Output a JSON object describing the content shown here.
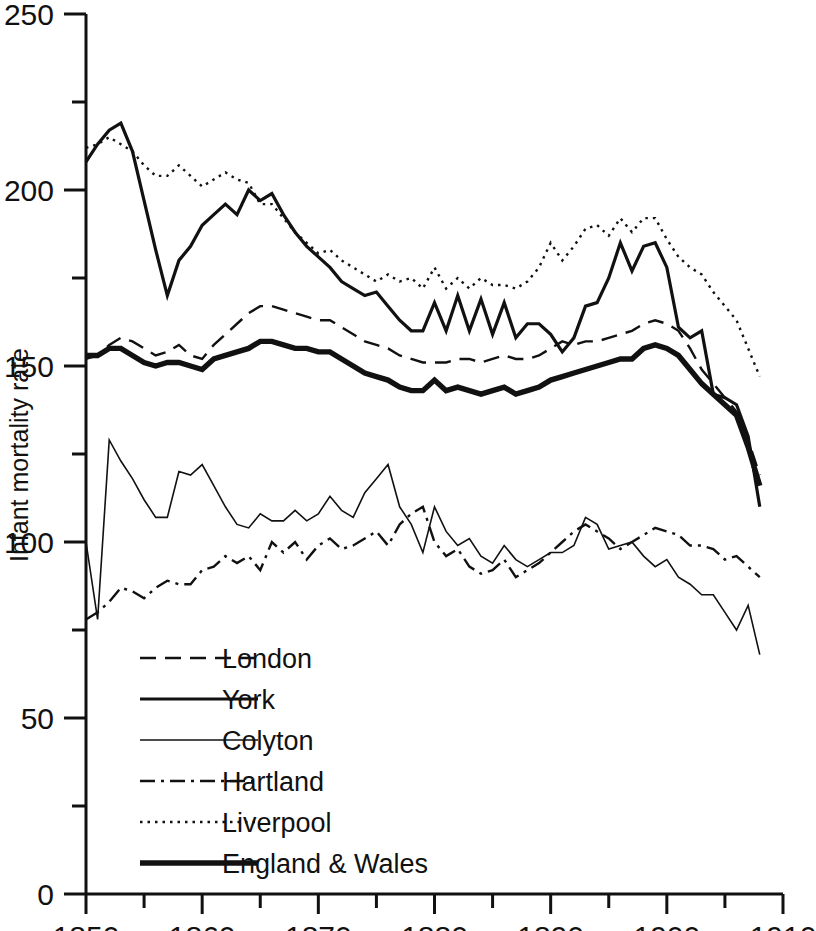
{
  "chart_data": {
    "type": "line",
    "title": "",
    "xlabel": "",
    "ylabel": "Infant mortality rate",
    "xlim": [
      1850,
      1910
    ],
    "ylim": [
      0,
      250
    ],
    "grid": false,
    "legend_position": "lower-left-inside",
    "x_ticks_major": [
      1850,
      1860,
      1870,
      1880,
      1890,
      1900,
      1910
    ],
    "x_ticks_minor": [
      1855,
      1865,
      1875,
      1885,
      1895,
      1905
    ],
    "x_tick_labels": [
      "1850",
      "1860",
      "1870",
      "1880",
      "1890",
      "1900",
      "1910"
    ],
    "y_ticks_major": [
      0,
      50,
      100,
      150,
      200,
      250
    ],
    "y_ticks_minor": [
      25,
      75,
      125,
      175,
      225
    ],
    "y_tick_labels": [
      "0",
      "50",
      "100",
      "150",
      "200",
      "250"
    ],
    "x": [
      1850,
      1851,
      1852,
      1853,
      1854,
      1855,
      1856,
      1857,
      1858,
      1859,
      1860,
      1861,
      1862,
      1863,
      1864,
      1865,
      1866,
      1867,
      1868,
      1869,
      1870,
      1871,
      1872,
      1873,
      1874,
      1875,
      1876,
      1877,
      1878,
      1879,
      1880,
      1881,
      1882,
      1883,
      1884,
      1885,
      1886,
      1887,
      1888,
      1889,
      1890,
      1891,
      1892,
      1893,
      1894,
      1895,
      1896,
      1897,
      1898,
      1899,
      1900,
      1901,
      1902,
      1903,
      1904,
      1905,
      1906,
      1907,
      1908
    ],
    "series": [
      {
        "name": "London",
        "style": "dashed",
        "width": 2.4,
        "values": [
          152,
          153,
          156,
          158,
          157,
          155,
          153,
          154,
          156,
          153,
          152,
          156,
          159,
          162,
          165,
          167,
          167,
          166,
          165,
          164,
          163,
          163,
          161,
          159,
          157,
          156,
          155,
          153,
          152,
          151,
          151,
          151,
          152,
          152,
          151,
          152,
          153,
          152,
          152,
          153,
          155,
          157,
          156,
          157,
          157,
          158,
          159,
          160,
          162,
          163,
          162,
          160,
          155,
          149,
          145,
          141,
          137,
          129,
          119
        ]
      },
      {
        "name": "York",
        "style": "solid",
        "width": 3.2,
        "values": [
          208,
          213,
          217,
          219,
          211,
          197,
          183,
          170,
          180,
          184,
          190,
          193,
          196,
          193,
          200,
          197,
          199,
          193,
          188,
          184,
          181,
          178,
          174,
          172,
          170,
          171,
          167,
          163,
          160,
          160,
          168,
          160,
          170,
          160,
          169,
          159,
          168,
          158,
          162,
          162,
          159,
          154,
          158,
          167,
          168,
          175,
          185,
          177,
          184,
          185,
          178,
          161,
          158,
          160,
          142,
          141,
          139,
          130,
          110
        ]
      },
      {
        "name": "Colyton",
        "style": "solid-thin",
        "width": 1.6,
        "values": [
          100,
          78,
          129,
          123,
          118,
          112,
          107,
          107,
          120,
          119,
          122,
          116,
          110,
          105,
          104,
          108,
          106,
          106,
          109,
          106,
          108,
          113,
          109,
          107,
          114,
          118,
          122,
          110,
          105,
          97,
          110,
          103,
          99,
          101,
          96,
          94,
          99,
          95,
          93,
          95,
          97,
          97,
          99,
          107,
          105,
          98,
          99,
          100,
          96,
          93,
          95,
          90,
          88,
          85,
          85,
          80,
          75,
          82,
          68
        ]
      },
      {
        "name": "Hartland",
        "style": "dash-dot",
        "width": 2.4,
        "values": [
          78,
          80,
          83,
          87,
          86,
          84,
          87,
          89,
          88,
          88,
          92,
          93,
          96,
          94,
          96,
          92,
          100,
          97,
          100,
          95,
          99,
          101,
          98,
          99,
          101,
          103,
          99,
          105,
          108,
          110,
          100,
          96,
          98,
          93,
          91,
          92,
          95,
          90,
          92,
          94,
          97,
          100,
          103,
          105,
          103,
          101,
          98,
          100,
          102,
          104,
          103,
          102,
          99,
          99,
          98,
          95,
          96,
          93,
          90
        ]
      },
      {
        "name": "Liverpool",
        "style": "dotted",
        "width": 2.4,
        "values": [
          212,
          213,
          215,
          213,
          211,
          207,
          204,
          204,
          207,
          204,
          201,
          203,
          205,
          203,
          202,
          196,
          196,
          192,
          188,
          185,
          182,
          183,
          180,
          178,
          176,
          174,
          176,
          174,
          175,
          172,
          178,
          172,
          175,
          172,
          175,
          173,
          173,
          172,
          174,
          178,
          185,
          180,
          184,
          189,
          190,
          187,
          192,
          188,
          192,
          192,
          186,
          181,
          178,
          176,
          171,
          167,
          163,
          155,
          147
        ]
      },
      {
        "name": "England & Wales",
        "style": "solid-thick",
        "width": 5.4,
        "values": [
          153,
          153,
          155,
          155,
          153,
          151,
          150,
          151,
          151,
          150,
          149,
          152,
          153,
          154,
          155,
          157,
          157,
          156,
          155,
          155,
          154,
          154,
          152,
          150,
          148,
          147,
          146,
          144,
          143,
          143,
          146,
          143,
          144,
          143,
          142,
          143,
          144,
          142,
          143,
          144,
          146,
          147,
          148,
          149,
          150,
          151,
          152,
          152,
          155,
          156,
          155,
          153,
          149,
          145,
          142,
          139,
          136,
          127,
          116
        ]
      }
    ],
    "legend_entries": [
      {
        "label": "London",
        "style": "dashed"
      },
      {
        "label": "York",
        "style": "solid"
      },
      {
        "label": "Colyton",
        "style": "solid-thin"
      },
      {
        "label": "Hartland",
        "style": "dash-dot"
      },
      {
        "label": "Liverpool",
        "style": "dotted"
      },
      {
        "label": "England & Wales",
        "style": "solid-thick"
      }
    ],
    "colors": {
      "line": "#111111",
      "axis": "#111111",
      "background": "#ffffff"
    }
  }
}
